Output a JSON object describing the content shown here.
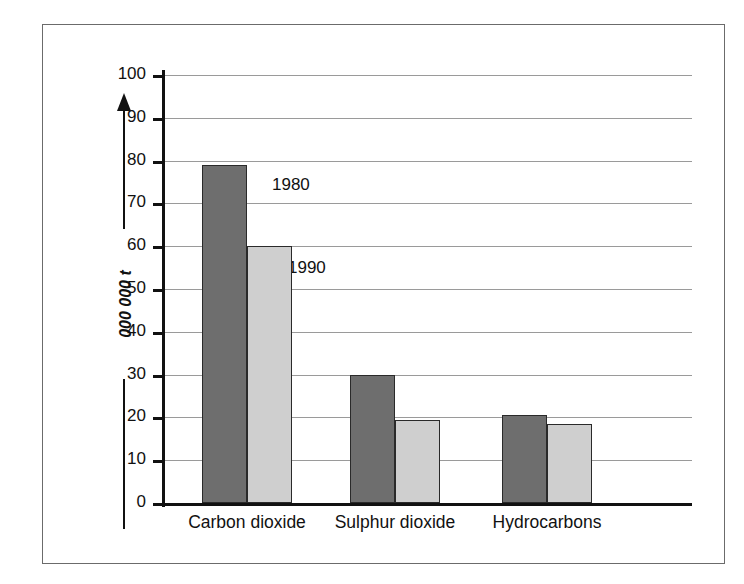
{
  "figure": {
    "source_credit": "SOURCE: Environmental Protection Agency",
    "y_axis_label": "000 000 t",
    "arrow_icon": "up-arrow-icon"
  },
  "chart_data": {
    "type": "bar",
    "title": "",
    "xlabel": "",
    "ylabel": "000 000 t",
    "ylim": [
      0,
      100
    ],
    "yticks": [
      0,
      10,
      20,
      30,
      40,
      50,
      60,
      70,
      80,
      90,
      100
    ],
    "ytick_labels": [
      "0",
      "10",
      "20",
      "30",
      "40",
      "50",
      "60",
      "70",
      "80",
      "90",
      "100"
    ],
    "grid": true,
    "legend_position": "inline-annotations",
    "categories": [
      "Carbon dioxide",
      "Sulphur dioxide",
      "Hydrocarbons"
    ],
    "series": [
      {
        "name": "1980",
        "color": "#6e6e6e",
        "values": [
          79,
          30,
          20.5
        ]
      },
      {
        "name": "1990",
        "color": "#cfcfcf",
        "values": [
          60,
          19.5,
          18.5
        ]
      }
    ],
    "annotations": [
      {
        "text": "1980",
        "series": "1980"
      },
      {
        "text": "1990",
        "series": "1990"
      }
    ]
  }
}
